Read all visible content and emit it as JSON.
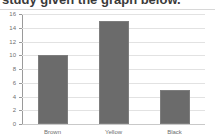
{
  "header": {
    "text": "study given the graph below."
  },
  "chart_data": {
    "type": "bar",
    "title": "",
    "subtitle": "",
    "xlabel": "",
    "ylabel": "",
    "categories": [
      "Brown",
      "Yellow",
      "Black"
    ],
    "values": [
      10,
      15,
      5
    ],
    "series": [
      {
        "name": "Count",
        "values": [
          10,
          15,
          5
        ]
      }
    ],
    "ylim": [
      0,
      16
    ],
    "ytick_step": 2,
    "yticks": [
      0,
      2,
      4,
      6,
      8,
      10,
      12,
      14,
      16
    ],
    "ytick_labels": [
      "0",
      "2",
      "4",
      "6",
      "8",
      "10",
      "12",
      "14",
      "16"
    ],
    "grid": true,
    "grid_axis": "y",
    "legend": false,
    "legend_position": "none",
    "bar_color": "#6b6b6b",
    "gridline_color": "#e2e2e2",
    "axis_color": "#9a9a9a",
    "background_color": "#ffffff",
    "annotations": []
  }
}
